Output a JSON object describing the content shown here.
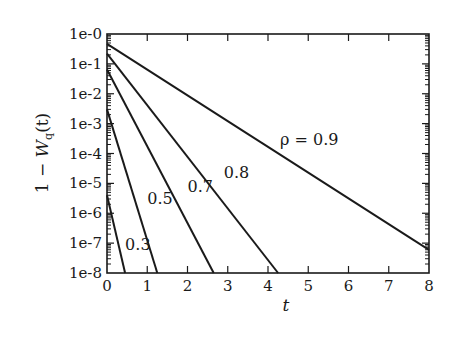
{
  "chart_data": {
    "type": "line",
    "title": "",
    "xlabel": "t",
    "ylabel": "1 − W_q(t)",
    "ylabel_parts": {
      "prefix": "1 − ",
      "main": "W",
      "sub": "q",
      "suffix": "(t)"
    },
    "xlim": [
      0,
      8
    ],
    "ylim": [
      1e-08,
      1
    ],
    "yscale": "log",
    "grid": false,
    "legend": "none (inline curve labels)",
    "x_ticks": [
      "0",
      "1",
      "2",
      "3",
      "4",
      "5",
      "6",
      "7",
      "8"
    ],
    "y_ticks": [
      "1e-0",
      "1e-1",
      "1e-2",
      "1e-3",
      "1e-4",
      "1e-5",
      "1e-6",
      "1e-7",
      "1e-8"
    ],
    "series": [
      {
        "name": "ρ = 0.9",
        "label": "ρ = 0.9",
        "points": [
          [
            0,
            0.47
          ],
          [
            8,
            6e-08
          ]
        ]
      },
      {
        "name": "0.8",
        "label": "0.8",
        "points": [
          [
            0,
            0.22
          ],
          [
            4.25,
            1e-08
          ]
        ]
      },
      {
        "name": "0.7",
        "label": "0.7",
        "points": [
          [
            0,
            0.065
          ],
          [
            2.65,
            1e-08
          ]
        ]
      },
      {
        "name": "0.5",
        "label": "0.5",
        "points": [
          [
            0,
            0.003
          ],
          [
            1.25,
            1e-08
          ]
        ]
      },
      {
        "name": "0.3",
        "label": "0.3",
        "points": [
          [
            0,
            4e-06
          ],
          [
            0.45,
            1e-08
          ]
        ]
      }
    ],
    "annotations": [
      {
        "text": "ρ = 0.9",
        "x": 4.3,
        "y": 0.0002
      },
      {
        "text": "0.8",
        "x": 2.9,
        "y": 1.5e-05
      },
      {
        "text": "0.7",
        "x": 2.0,
        "y": 5e-06
      },
      {
        "text": "0.5",
        "x": 1.0,
        "y": 2e-06
      },
      {
        "text": "0.3",
        "x": 0.45,
        "y": 6e-08
      }
    ]
  }
}
